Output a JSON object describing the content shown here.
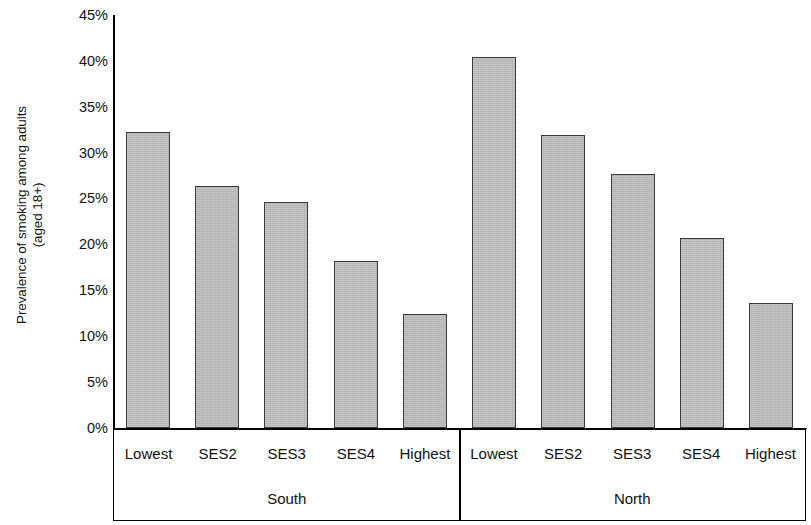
{
  "chart_data": {
    "type": "bar",
    "title": "",
    "xlabel": "",
    "ylabel": "Prevalence of smoking among adults (aged 18+)",
    "ylabel_line1": "Prevalence of smoking among adults",
    "ylabel_line2": "(aged 18+)",
    "ylim": [
      0,
      45
    ],
    "ytick_labels": [
      "45%",
      "40%",
      "35%",
      "30%",
      "25%",
      "20%",
      "15%",
      "10%",
      "5%",
      "0%"
    ],
    "ytick_values": [
      45,
      40,
      35,
      30,
      25,
      20,
      15,
      10,
      5,
      0
    ],
    "grid": false,
    "legend": "none",
    "categories": [
      "Lowest",
      "SES2",
      "SES3",
      "SES4",
      "Highest",
      "Lowest",
      "SES2",
      "SES3",
      "SES4",
      "Highest"
    ],
    "groups": [
      {
        "name": "South",
        "span": 5
      },
      {
        "name": "North",
        "span": 5
      }
    ],
    "series": [
      {
        "name": "Prevalence of smoking among adults (aged 18+)",
        "values": [
          32.2,
          26.4,
          24.6,
          18.2,
          12.4,
          40.4,
          31.9,
          27.7,
          20.7,
          13.6
        ]
      }
    ],
    "points": [
      {
        "group": "South",
        "category": "Lowest",
        "value": 32.2
      },
      {
        "group": "South",
        "category": "SES2",
        "value": 26.4
      },
      {
        "group": "South",
        "category": "SES3",
        "value": 24.6
      },
      {
        "group": "South",
        "category": "SES4",
        "value": 18.2
      },
      {
        "group": "South",
        "category": "Highest",
        "value": 12.4
      },
      {
        "group": "North",
        "category": "Lowest",
        "value": 40.4
      },
      {
        "group": "North",
        "category": "SES2",
        "value": 31.9
      },
      {
        "group": "North",
        "category": "SES3",
        "value": 27.7
      },
      {
        "group": "North",
        "category": "SES4",
        "value": 20.7
      },
      {
        "group": "North",
        "category": "Highest",
        "value": 13.6
      }
    ],
    "colors": {
      "bar_fill": "#bcbcbc",
      "bar_border": "#3a3a3a",
      "axis": "#000000",
      "text": "#111111",
      "background": "#ffffff"
    }
  }
}
